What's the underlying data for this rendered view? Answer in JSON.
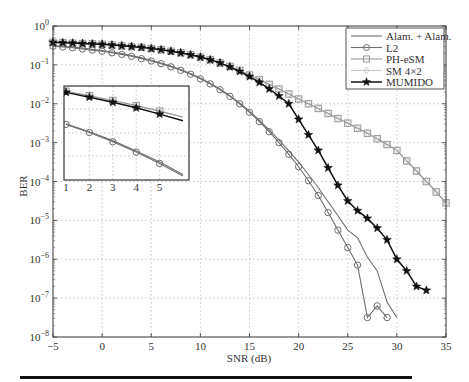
{
  "chart_data": {
    "type": "line",
    "title": "",
    "xlabel": "SNR (dB)",
    "ylabel": "BER",
    "xlim": [
      -5,
      35
    ],
    "ylim": [
      1e-08,
      1
    ],
    "yscale": "log",
    "grid": true,
    "legend_position": "upper right",
    "x_ticks": [
      -5,
      0,
      5,
      10,
      15,
      20,
      25,
      30,
      35
    ],
    "y_ticks": [
      "10^0",
      "10^-1",
      "10^-2",
      "10^-3",
      "10^-4",
      "10^-5",
      "10^-6",
      "10^-7",
      "10^-8"
    ],
    "series": [
      {
        "name": "Alam. + Alam.",
        "marker": "none",
        "color": "#6e6e6e",
        "x": [
          -5,
          -4,
          -3,
          -2,
          -1,
          0,
          1,
          2,
          3,
          4,
          5,
          6,
          7,
          8,
          9,
          10,
          11,
          12,
          13,
          14,
          15,
          16,
          17,
          18,
          19,
          20,
          21,
          22,
          23,
          24,
          25,
          26,
          27,
          28,
          29,
          30
        ],
        "log10_ber": [
          -0.5,
          -0.52,
          -0.54,
          -0.57,
          -0.6,
          -0.63,
          -0.67,
          -0.71,
          -0.76,
          -0.82,
          -0.88,
          -0.95,
          -1.03,
          -1.12,
          -1.22,
          -1.34,
          -1.47,
          -1.62,
          -1.79,
          -1.98,
          -2.19,
          -2.42,
          -2.67,
          -2.93,
          -3.21,
          -3.5,
          -3.82,
          -4.16,
          -4.52,
          -4.88,
          -5.25,
          -5.45,
          -5.95,
          -6.3,
          -7.1,
          -7.5
        ]
      },
      {
        "name": "L2",
        "marker": "circle",
        "color": "#6e6e6e",
        "x": [
          -5,
          -4,
          -3,
          -2,
          -1,
          0,
          1,
          2,
          3,
          4,
          5,
          6,
          7,
          8,
          9,
          10,
          11,
          12,
          13,
          14,
          15,
          16,
          17,
          18,
          19,
          20,
          21,
          22,
          23,
          24,
          25,
          26,
          27,
          28,
          29
        ],
        "log10_ber": [
          -0.52,
          -0.54,
          -0.56,
          -0.59,
          -0.62,
          -0.65,
          -0.69,
          -0.73,
          -0.78,
          -0.84,
          -0.9,
          -0.97,
          -1.05,
          -1.14,
          -1.24,
          -1.36,
          -1.49,
          -1.64,
          -1.81,
          -2.0,
          -2.22,
          -2.46,
          -2.72,
          -3.0,
          -3.3,
          -3.62,
          -3.98,
          -4.36,
          -4.8,
          -5.25,
          -5.7,
          -6.15,
          -7.5,
          -7.2,
          -7.5
        ]
      },
      {
        "name": "PH-eSM",
        "marker": "square",
        "color": "#9a9a9a",
        "x": [
          -5,
          -4,
          -3,
          -2,
          -1,
          0,
          1,
          2,
          3,
          4,
          5,
          6,
          7,
          8,
          9,
          10,
          11,
          12,
          13,
          14,
          15,
          16,
          17,
          18,
          19,
          20,
          21,
          22,
          23,
          24,
          25,
          26,
          27,
          28,
          29,
          30,
          31,
          32,
          33,
          34,
          35
        ],
        "log10_ber": [
          -0.42,
          -0.43,
          -0.44,
          -0.45,
          -0.46,
          -0.47,
          -0.49,
          -0.51,
          -0.53,
          -0.55,
          -0.58,
          -0.61,
          -0.65,
          -0.69,
          -0.74,
          -0.8,
          -0.87,
          -0.95,
          -1.04,
          -1.14,
          -1.26,
          -1.38,
          -1.5,
          -1.62,
          -1.75,
          -1.88,
          -2.0,
          -2.12,
          -2.25,
          -2.38,
          -2.5,
          -2.63,
          -2.76,
          -2.9,
          -3.05,
          -3.2,
          -3.47,
          -3.73,
          -4.0,
          -4.27,
          -4.55
        ]
      },
      {
        "name": "SM 4×2",
        "marker": "diamond",
        "color": "#c8c8c8",
        "x": [
          -5,
          -4,
          -3,
          -2,
          -1,
          0,
          1,
          2,
          3,
          4,
          5,
          6,
          7,
          8,
          9,
          10,
          11,
          12,
          13,
          14,
          15,
          16,
          17,
          18,
          19,
          20,
          21,
          22,
          23,
          24,
          25,
          26,
          27,
          28,
          29,
          30,
          31,
          32,
          33,
          34,
          35
        ],
        "log10_ber": [
          -0.42,
          -0.43,
          -0.44,
          -0.45,
          -0.46,
          -0.47,
          -0.49,
          -0.51,
          -0.53,
          -0.55,
          -0.58,
          -0.61,
          -0.65,
          -0.69,
          -0.74,
          -0.8,
          -0.87,
          -0.95,
          -1.04,
          -1.14,
          -1.26,
          -1.38,
          -1.5,
          -1.62,
          -1.75,
          -1.88,
          -2.0,
          -2.12,
          -2.25,
          -2.38,
          -2.5,
          -2.63,
          -2.76,
          -2.9,
          -3.05,
          -3.2,
          -3.47,
          -3.73,
          -4.0,
          -4.27,
          -4.55
        ]
      },
      {
        "name": "MUMIDO",
        "marker": "star",
        "color": "#111111",
        "x": [
          -5,
          -4,
          -3,
          -2,
          -1,
          0,
          1,
          2,
          3,
          4,
          5,
          6,
          7,
          8,
          9,
          10,
          11,
          12,
          13,
          14,
          15,
          16,
          17,
          18,
          19,
          20,
          21,
          22,
          23,
          24,
          25,
          26,
          27,
          28,
          29,
          30,
          31,
          32,
          33
        ],
        "log10_ber": [
          -0.42,
          -0.43,
          -0.44,
          -0.45,
          -0.46,
          -0.47,
          -0.49,
          -0.51,
          -0.53,
          -0.55,
          -0.58,
          -0.61,
          -0.65,
          -0.69,
          -0.74,
          -0.8,
          -0.87,
          -0.95,
          -1.05,
          -1.17,
          -1.3,
          -1.45,
          -1.62,
          -1.8,
          -2.0,
          -2.4,
          -2.8,
          -3.2,
          -3.65,
          -4.1,
          -4.5,
          -4.75,
          -4.95,
          -5.2,
          -5.5,
          -6.0,
          -6.3,
          -6.7,
          -6.8
        ]
      }
    ],
    "inset": {
      "x_ticks": [
        1,
        2,
        3,
        4,
        5
      ],
      "xlim": [
        1,
        6
      ],
      "series_shown": [
        "L2",
        "Alam. + Alam.",
        "PH-eSM",
        "SM 4×2",
        "MUMIDO"
      ]
    }
  },
  "labels": {
    "xlabel": "SNR (dB)",
    "ylabel": "BER",
    "legend": [
      "Alam. + Alam.",
      "L2",
      "PH-eSM",
      "SM 4×2",
      "MUMIDO"
    ],
    "x_ticks": [
      "−5",
      "0",
      "5",
      "10",
      "15",
      "20",
      "25",
      "30",
      "35"
    ],
    "inset_ticks": [
      "1",
      "2",
      "3",
      "4",
      "5"
    ]
  }
}
